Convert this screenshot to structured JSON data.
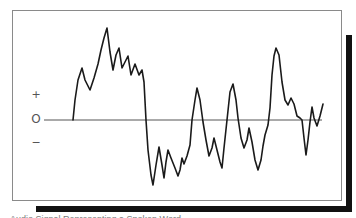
{
  "chart_data": {
    "type": "line",
    "title": "",
    "xlabel": "",
    "ylabel": "",
    "y_tick_labels": [
      "+",
      "O",
      "−"
    ],
    "baseline_label": "O",
    "grid": false,
    "legend": null,
    "series": [
      {
        "name": "waveform",
        "color": "#1a1a1a",
        "points_px": [
          [
            73,
            120
          ],
          [
            75,
            100
          ],
          [
            78,
            80
          ],
          [
            82,
            68
          ],
          [
            85,
            80
          ],
          [
            90,
            90
          ],
          [
            94,
            78
          ],
          [
            98,
            64
          ],
          [
            101,
            50
          ],
          [
            104,
            38
          ],
          [
            107,
            28
          ],
          [
            110,
            52
          ],
          [
            113,
            70
          ],
          [
            116,
            55
          ],
          [
            119,
            48
          ],
          [
            122,
            68
          ],
          [
            125,
            62
          ],
          [
            128,
            56
          ],
          [
            131,
            75
          ],
          [
            135,
            64
          ],
          [
            139,
            75
          ],
          [
            142,
            70
          ],
          [
            144,
            82
          ],
          [
            146,
            120
          ],
          [
            148,
            150
          ],
          [
            151,
            175
          ],
          [
            153,
            185
          ],
          [
            156,
            165
          ],
          [
            159,
            147
          ],
          [
            162,
            165
          ],
          [
            164,
            178
          ],
          [
            166,
            162
          ],
          [
            168,
            150
          ],
          [
            171,
            158
          ],
          [
            175,
            168
          ],
          [
            178,
            176
          ],
          [
            180,
            170
          ],
          [
            182,
            158
          ],
          [
            184,
            164
          ],
          [
            187,
            156
          ],
          [
            190,
            145
          ],
          [
            192,
            120
          ],
          [
            195,
            100
          ],
          [
            197,
            88
          ],
          [
            200,
            100
          ],
          [
            203,
            122
          ],
          [
            206,
            140
          ],
          [
            209,
            156
          ],
          [
            212,
            148
          ],
          [
            214,
            138
          ],
          [
            217,
            150
          ],
          [
            220,
            162
          ],
          [
            222,
            168
          ],
          [
            224,
            148
          ],
          [
            227,
            120
          ],
          [
            230,
            92
          ],
          [
            233,
            84
          ],
          [
            236,
            100
          ],
          [
            238,
            118
          ],
          [
            241,
            138
          ],
          [
            244,
            148
          ],
          [
            247,
            140
          ],
          [
            249,
            128
          ],
          [
            252,
            142
          ],
          [
            255,
            160
          ],
          [
            258,
            170
          ],
          [
            261,
            160
          ],
          [
            263,
            146
          ],
          [
            265,
            135
          ],
          [
            268,
            125
          ],
          [
            270,
            108
          ],
          [
            272,
            75
          ],
          [
            274,
            56
          ],
          [
            276,
            48
          ],
          [
            279,
            55
          ],
          [
            282,
            82
          ],
          [
            285,
            100
          ],
          [
            288,
            105
          ],
          [
            291,
            98
          ],
          [
            294,
            104
          ],
          [
            297,
            116
          ],
          [
            300,
            118
          ],
          [
            302,
            120
          ],
          [
            304,
            138
          ],
          [
            306,
            155
          ],
          [
            308,
            140
          ],
          [
            310,
            122
          ],
          [
            312,
            107
          ],
          [
            314,
            118
          ],
          [
            317,
            126
          ],
          [
            320,
            116
          ],
          [
            323,
            104
          ]
        ]
      }
    ],
    "baseline_y_px": 120,
    "xlim_px": [
      44,
      322
    ]
  },
  "axis": {
    "plus_label": "+",
    "zero_label": "O",
    "minus_label": "−"
  },
  "caption": {
    "text": "Audio Signal Representing a Spoken Word"
  }
}
